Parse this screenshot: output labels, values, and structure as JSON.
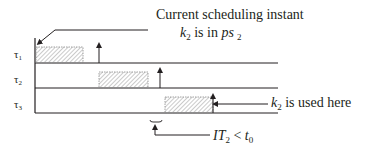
{
  "diagram": {
    "tasks": [
      {
        "label": "τ",
        "sub": "1"
      },
      {
        "label": "τ",
        "sub": "2"
      },
      {
        "label": "τ",
        "sub": "3"
      }
    ],
    "annotations": {
      "top_line1": "Current scheduling instant",
      "top_k": "k",
      "top_k_sub": "2",
      "top_mid": " is in ",
      "top_ps": "ps",
      "top_ps_sub": "2",
      "right_k": "k",
      "right_k_sub": "2",
      "right_text": " is used here",
      "bottom_IT": "IT",
      "bottom_IT_sub": "2",
      "bottom_lt": " < ",
      "bottom_t": "t",
      "bottom_t_sub": "0"
    },
    "colors": {
      "line": "#231f20",
      "hatch": "#8a8a8a"
    }
  }
}
